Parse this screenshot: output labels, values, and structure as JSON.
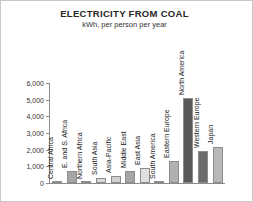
{
  "chart_data": {
    "type": "bar",
    "title": "ELECTRICITY FROM COAL",
    "subtitle": "kWh, per person per year",
    "xlabel": "",
    "ylabel": "",
    "ylim": [
      0,
      6000
    ],
    "yticks": [
      0,
      1000,
      2000,
      3000,
      4000,
      5000,
      6000
    ],
    "ytick_labels": [
      "0",
      "1,000",
      "2,000",
      "3,000",
      "4,000",
      "5,000",
      "6,000"
    ],
    "grid": false,
    "legend": "none",
    "categories": [
      "Central Africa",
      "E. and S. Africa",
      "Northern Africa",
      "South Asia",
      "Asia-Pacific",
      "Middle East",
      "East Asia",
      "South America",
      "Eastern Europe",
      "North America",
      "Western Europe",
      "Japan"
    ],
    "values": [
      30,
      700,
      40,
      330,
      430,
      700,
      900,
      60,
      1350,
      5100,
      1950,
      2150
    ],
    "bar_colors": [
      "#bfbfbf",
      "#a6a6a6",
      "#bfbfbf",
      "#d9d9d9",
      "#d0d0d0",
      "#a6a6a6",
      "#e0e0e0",
      "#d9d9d9",
      "#b0b0b0",
      "#595959",
      "#6b6b6b",
      "#b8b8b8"
    ]
  },
  "style": {
    "axis_color": "#8c8c8c",
    "frame_color": "#c8c8c8",
    "text_color": "#262626",
    "background": "#ffffff"
  }
}
